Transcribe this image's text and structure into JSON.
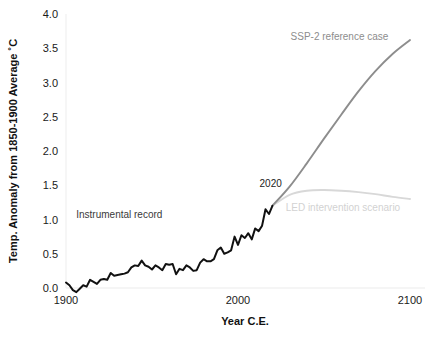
{
  "chart_data": {
    "type": "line",
    "title": "",
    "xlabel": "Year C.E.",
    "ylabel": "Temp. Anomaly  from 1850-1900 Average ˚C",
    "xlim": [
      1900,
      2100
    ],
    "ylim": [
      0.0,
      4.0
    ],
    "grid": false,
    "legend_position": "inline-annotations",
    "xticks": [
      "1900",
      "2000",
      "2100"
    ],
    "xtick_values": [
      1900,
      2000,
      2100
    ],
    "yticks": [
      "0.0",
      "0.5",
      "1.0",
      "1.5",
      "2.0",
      "2.5",
      "3.0",
      "3.5",
      "4.0"
    ],
    "ytick_values": [
      0.0,
      0.5,
      1.0,
      1.5,
      2.0,
      2.5,
      3.0,
      3.5,
      4.0
    ],
    "colors": {
      "instrumental": "#111111",
      "ssp2": "#8d8d8d",
      "led": "#d8d8d8",
      "axis": "#f0f0f0",
      "text": "#1a1a1a"
    },
    "annotations": [
      {
        "name": "instrumental-record-label",
        "text": "Instrumental record",
        "x": 1931,
        "y": 1.02,
        "color": "#3a3a3a"
      },
      {
        "name": "ssp2-reference-label",
        "text": "SSP-2 reference case",
        "x": 2059,
        "y": 3.62,
        "color": "#8d8d8d"
      },
      {
        "name": "branch-year-label",
        "text": "2020",
        "x": 2019,
        "y": 1.48,
        "color": "#222222"
      },
      {
        "name": "led-intervention-label",
        "text": "LED intervention scenario",
        "x": 2061,
        "y": 1.12,
        "color": "#d2d2d2"
      }
    ],
    "series": [
      {
        "name": "Instrumental record",
        "color": "#111111",
        "x": [
          1900,
          1902,
          1904,
          1906,
          1908,
          1910,
          1912,
          1914,
          1916,
          1918,
          1920,
          1922,
          1924,
          1926,
          1928,
          1930,
          1932,
          1934,
          1936,
          1938,
          1940,
          1942,
          1944,
          1946,
          1948,
          1950,
          1952,
          1954,
          1956,
          1958,
          1960,
          1962,
          1964,
          1966,
          1968,
          1970,
          1972,
          1974,
          1976,
          1978,
          1980,
          1982,
          1984,
          1986,
          1988,
          1990,
          1992,
          1994,
          1996,
          1998,
          2000,
          2002,
          2004,
          2006,
          2008,
          2010,
          2012,
          2014,
          2016,
          2018,
          2020
        ],
        "y": [
          0.08,
          0.04,
          -0.03,
          -0.06,
          -0.01,
          0.04,
          0.02,
          0.12,
          0.09,
          0.06,
          0.12,
          0.13,
          0.12,
          0.22,
          0.18,
          0.19,
          0.2,
          0.21,
          0.23,
          0.3,
          0.33,
          0.32,
          0.4,
          0.33,
          0.31,
          0.27,
          0.33,
          0.3,
          0.26,
          0.35,
          0.34,
          0.35,
          0.2,
          0.28,
          0.26,
          0.33,
          0.3,
          0.25,
          0.26,
          0.37,
          0.42,
          0.39,
          0.39,
          0.42,
          0.55,
          0.59,
          0.5,
          0.52,
          0.55,
          0.75,
          0.63,
          0.77,
          0.73,
          0.8,
          0.71,
          0.87,
          0.83,
          0.91,
          1.15,
          1.08,
          1.2
        ]
      },
      {
        "name": "SSP-2 reference case",
        "color": "#8d8d8d",
        "x": [
          2020,
          2030,
          2040,
          2050,
          2060,
          2070,
          2080,
          2090,
          2100
        ],
        "y": [
          1.2,
          1.48,
          1.82,
          2.18,
          2.53,
          2.87,
          3.17,
          3.42,
          3.62
        ]
      },
      {
        "name": "LED intervention scenario",
        "color": "#d8d8d8",
        "x": [
          2020,
          2030,
          2040,
          2050,
          2060,
          2070,
          2080,
          2090,
          2100
        ],
        "y": [
          1.2,
          1.36,
          1.42,
          1.43,
          1.42,
          1.4,
          1.37,
          1.33,
          1.3
        ]
      }
    ]
  }
}
